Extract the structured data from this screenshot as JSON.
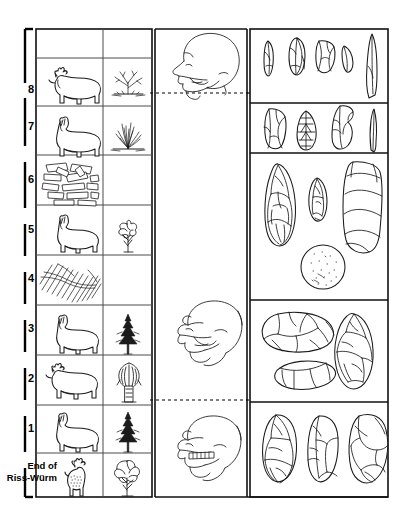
{
  "figure": {
    "type": "stratigraphic-correlation-chart",
    "orientation": "vertical"
  },
  "axis": {
    "name": "level-axis",
    "direction": "bottom-to-top",
    "tick_labels": [
      "8",
      "7",
      "6",
      "5",
      "4",
      "3",
      "2",
      "1"
    ],
    "base_label_line1": "End of",
    "base_label_line2": "Riss-Würm",
    "base_label_full": "End of Riss-Würm"
  },
  "columns": [
    {
      "key": "fauna",
      "name": "fauna-column",
      "header": ""
    },
    {
      "key": "flora",
      "name": "flora-column",
      "header": ""
    },
    {
      "key": "heads",
      "name": "hominid-column",
      "header": ""
    },
    {
      "key": "tools",
      "name": "tools-column",
      "header": ""
    }
  ],
  "rows": [
    {
      "level": "",
      "fauna": "",
      "flora": ""
    },
    {
      "level": "8",
      "fauna": "reindeer",
      "flora": "dwarf-shrub"
    },
    {
      "level": "7",
      "fauna": "horse",
      "flora": "grass-tuft"
    },
    {
      "level": "6",
      "fauna": "log-pile",
      "flora": ""
    },
    {
      "level": "5",
      "fauna": "horse",
      "flora": "broadleaf-tree"
    },
    {
      "level": "4",
      "fauna": "hatching",
      "flora": ""
    },
    {
      "level": "3",
      "fauna": "horse",
      "flora": "conifer"
    },
    {
      "level": "2",
      "fauna": "reindeer",
      "flora": "willow-tree"
    },
    {
      "level": "1",
      "fauna": "horse",
      "flora": "conifer"
    },
    {
      "level": "End of Riss-Würm",
      "fauna": "red-deer",
      "flora": "oak-tree"
    }
  ],
  "heads": [
    {
      "name": "head-modern-human",
      "label": "",
      "position": "top"
    },
    {
      "name": "head-neanderthal",
      "label": "",
      "position": "middle"
    },
    {
      "name": "head-archaic-hominid",
      "label": "",
      "position": "bottom"
    }
  ],
  "separators": {
    "dotted_line_count": 2,
    "style": "dashed"
  },
  "tool_panels": [
    {
      "name": "tool-panel-1",
      "tools": [
        "blade",
        "flake-tool",
        "scraper",
        "lunate",
        "long-point"
      ],
      "count": 5
    },
    {
      "name": "tool-panel-2",
      "tools": [
        "core-scraper",
        "leaf-point",
        "notched-flake",
        "awl"
      ],
      "count": 4
    },
    {
      "name": "tool-panel-3",
      "tools": [
        "large-handaxe",
        "small-point",
        "elongated-core",
        "stone-ball"
      ],
      "count": 4
    },
    {
      "name": "tool-panel-4",
      "tools": [
        "chopper-core",
        "flat-flake",
        "ovate-handaxe"
      ],
      "count": 3
    },
    {
      "name": "tool-panel-5",
      "tools": [
        "oval-biface",
        "elongate-biface",
        "discoid-core"
      ],
      "count": 3
    }
  ],
  "colors": {
    "ink": "#1a1a1a",
    "grid": "#4a4a4a",
    "axis": "#000000",
    "paper": "#ffffff"
  }
}
